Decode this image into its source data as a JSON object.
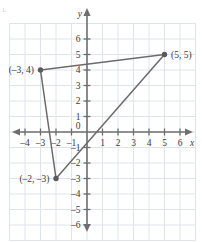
{
  "figure": {
    "mark": "1.",
    "colors": {
      "grid": "#dfe4ec",
      "axis": "#6f6f6f",
      "shape_stroke": "#6b6b6b",
      "point_fill": "#5a5a5a",
      "text": "#3a3a3a",
      "background": "#ffffff"
    }
  },
  "chart_data": {
    "type": "scatter",
    "title": "",
    "xlabel": "x",
    "ylabel": "y",
    "xlim": [
      -4.8,
      6.8
    ],
    "ylim": [
      -6.8,
      6.8
    ],
    "grid": true,
    "legend": "none",
    "x_ticks": [
      -4,
      -3,
      -2,
      -1,
      0,
      1,
      2,
      3,
      4,
      5,
      6
    ],
    "x_tick_labels": [
      "–4",
      "–3",
      "–2",
      "–1",
      "0",
      "1",
      "2",
      "3",
      "4",
      "5",
      "6"
    ],
    "y_ticks": [
      -6,
      -5,
      -4,
      -3,
      -2,
      -1,
      1,
      2,
      3,
      4,
      5,
      6
    ],
    "y_tick_labels": [
      "–6",
      "–5",
      "–4",
      "–3",
      "–2",
      "–1",
      "1",
      "2",
      "3",
      "4",
      "5",
      "6"
    ],
    "origin_label": "0",
    "points": [
      {
        "name": "vertex-a",
        "x": -3,
        "y": 4,
        "label": "(–3, 4)",
        "label_side": "left"
      },
      {
        "name": "vertex-b",
        "x": 5,
        "y": 5,
        "label": "(5, 5)",
        "label_side": "right"
      },
      {
        "name": "vertex-c",
        "x": -2,
        "y": -3,
        "label": "(–2, –3)",
        "label_side": "left"
      }
    ],
    "shapes": [
      {
        "name": "triangle",
        "type": "polygon",
        "closed": true,
        "vertices": [
          [
            -3,
            4
          ],
          [
            5,
            5
          ],
          [
            -2,
            -3
          ]
        ]
      }
    ]
  }
}
